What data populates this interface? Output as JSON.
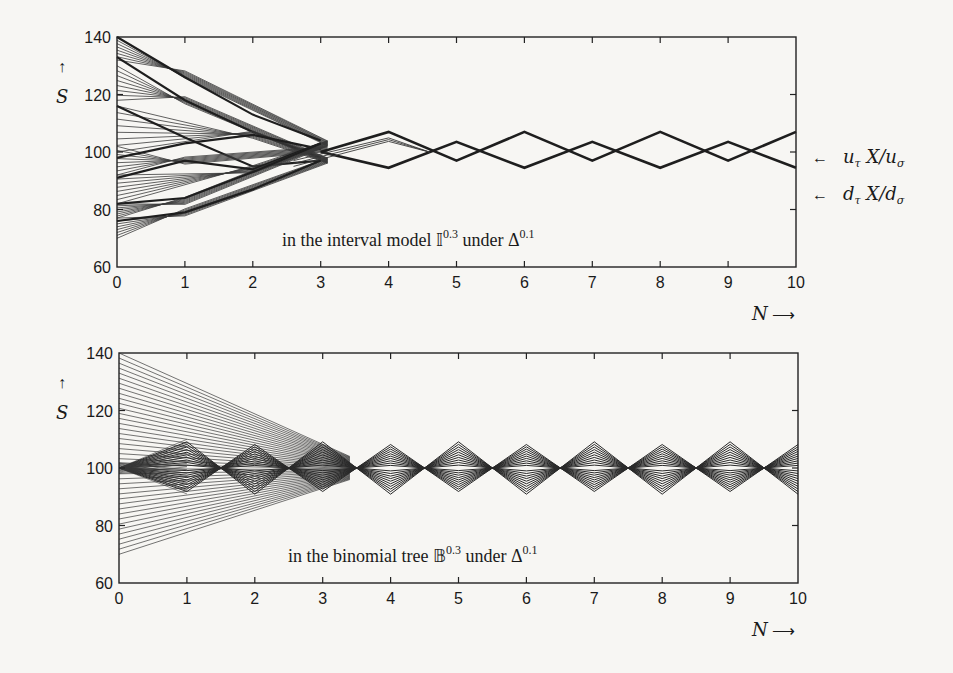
{
  "chart_data": [
    {
      "type": "line",
      "panel": "top",
      "annotation": {
        "prefix": "in the interval model ",
        "symbol": "𝕀",
        "sup": "0.3",
        "mid": " under ",
        "symbol2": "Δ",
        "sup2": "0.1"
      },
      "xlabel": "N",
      "ylabel": "S",
      "xlim": [
        0,
        10
      ],
      "ylim": [
        60,
        140
      ],
      "xticks": [
        0,
        1,
        2,
        3,
        4,
        5,
        6,
        7,
        8,
        9,
        10
      ],
      "yticks": [
        60,
        80,
        100,
        120,
        140
      ],
      "grid": false,
      "right_labels": [
        {
          "text": "u_τ X / u_σ",
          "y": 107
        },
        {
          "text": "d_τ X / d_σ",
          "y": 95
        }
      ],
      "series": [
        {
          "name": "upper bound path (u_τ X/u_σ)",
          "x": [
            0,
            1,
            2,
            3,
            4,
            5,
            6,
            7,
            8,
            9,
            10
          ],
          "values": [
            140,
            125,
            112,
            103,
            107,
            100,
            107,
            100,
            107,
            100,
            107
          ]
        },
        {
          "name": "lower bound path (d_τ X/d_σ)",
          "x": [
            0,
            1,
            2,
            3,
            4,
            5,
            6,
            7,
            8,
            9,
            10
          ],
          "values": [
            70,
            78,
            88,
            97,
            95,
            100,
            95,
            100,
            95,
            100,
            95
          ]
        },
        {
          "name": "tail converging oscillation",
          "x": [
            3,
            4,
            5,
            6,
            7,
            8,
            9,
            10
          ],
          "upper": [
            100,
            107,
            103.5,
            107,
            103.5,
            107,
            103.5,
            107
          ],
          "lower": [
            100,
            94.5,
            97,
            94.5,
            97,
            94.5,
            97,
            94.5
          ]
        }
      ],
      "fan_start_range": [
        70,
        140
      ]
    },
    {
      "type": "line",
      "panel": "bottom",
      "annotation": {
        "prefix": "in the binomial tree ",
        "symbol": "𝔹",
        "sup": "0.3",
        "mid": " under ",
        "symbol2": "Δ",
        "sup2": "0.1"
      },
      "xlabel": "N",
      "ylabel": "S",
      "xlim": [
        0,
        10
      ],
      "ylim": [
        60,
        140
      ],
      "xticks": [
        0,
        1,
        2,
        3,
        4,
        5,
        6,
        7,
        8,
        9,
        10
      ],
      "yticks": [
        60,
        80,
        100,
        120,
        140
      ],
      "grid": false,
      "series": [
        {
          "name": "fan upper bound",
          "x": [
            0,
            1,
            2,
            3
          ],
          "values": [
            140,
            127,
            114,
            102
          ]
        },
        {
          "name": "fan lower bound",
          "x": [
            0,
            1,
            2,
            3
          ],
          "values": [
            70,
            77,
            86,
            98
          ]
        },
        {
          "name": "diamond envelope upper",
          "x": [
            0,
            1,
            2,
            3,
            4,
            5,
            6,
            7,
            8,
            9,
            10
          ],
          "values": [
            100,
            110,
            110,
            110,
            110,
            110,
            110,
            110,
            110,
            110,
            110
          ]
        },
        {
          "name": "diamond envelope lower",
          "x": [
            0,
            1,
            2,
            3,
            4,
            5,
            6,
            7,
            8,
            9,
            10
          ],
          "values": [
            100,
            91,
            91,
            91,
            91,
            91,
            91,
            91,
            91,
            91,
            91
          ]
        }
      ],
      "fan_start_range": [
        70,
        140
      ]
    }
  ],
  "labels": {
    "y_axis": "S",
    "x_axis": "N",
    "arrow_up": "↑",
    "arrow_right": "⟶",
    "arrow_left": "←",
    "upper_label": "u",
    "upper_label_sub": "τ",
    "upper_label_mid": " X/u",
    "upper_label_sub2": "σ",
    "lower_label": "d",
    "lower_label_sub": "τ",
    "lower_label_mid": " X/d",
    "lower_label_sub2": "σ",
    "top_annotation_text": "in the interval model ",
    "top_annotation_symbol": "𝕀",
    "top_annotation_sup": "0.3",
    "top_annotation_under": " under Δ",
    "top_annotation_sup2": "0.1",
    "bottom_annotation_text": "in the binomial tree ",
    "bottom_annotation_symbol": "𝔹",
    "bottom_annotation_sup": "0.3",
    "bottom_annotation_under": " under Δ",
    "bottom_annotation_sup2": "0.1"
  },
  "colors": {
    "line": "#1e1e1e",
    "thin_line": "#3a3a3a",
    "axis": "#222222",
    "background": "#f7f6f3"
  }
}
